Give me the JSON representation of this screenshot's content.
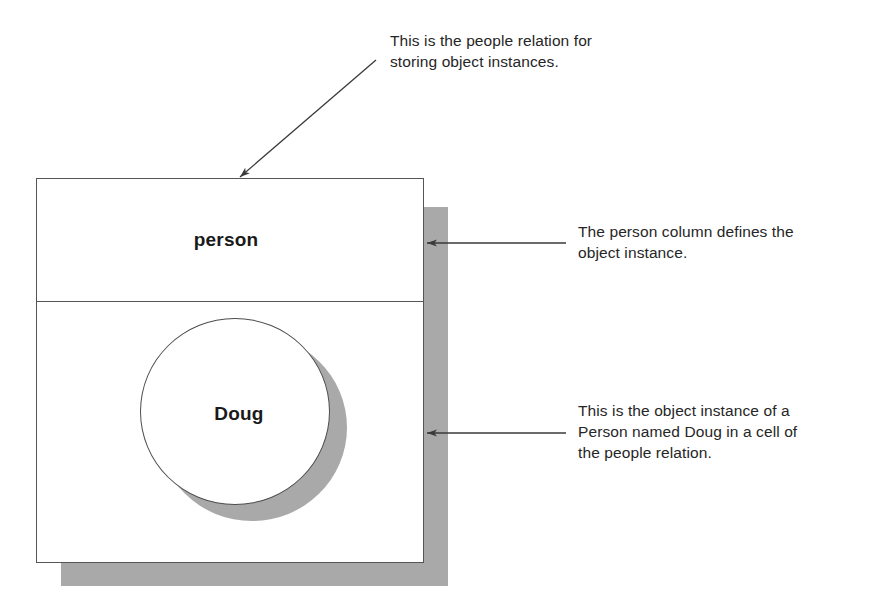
{
  "diagram": {
    "title_present": false,
    "colors": {
      "shadow_gray": "#a9a9a9",
      "outline": "#555555",
      "text": "#262626",
      "background": "#ffffff"
    },
    "table": {
      "header_label": "person",
      "cell": {
        "instance_label": "Doug"
      }
    },
    "annotations": [
      {
        "name": "relation-note",
        "text": "This is the people relation for\nstoring object instances.",
        "arrow": "diagonal-down-left"
      },
      {
        "name": "column-note",
        "text": "The person column defines the\nobject instance.",
        "arrow": "left"
      },
      {
        "name": "instance-note",
        "text": "This is the object instance of a\nPerson named Doug in a cell of\nthe people relation.",
        "arrow": "left"
      }
    ]
  }
}
